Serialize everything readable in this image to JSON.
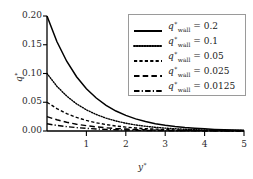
{
  "chart_data": {
    "type": "line",
    "title": "",
    "xlabel": "y*",
    "ylabel": "q*",
    "xlim": [
      0,
      5
    ],
    "ylim": [
      0,
      0.2
    ],
    "grid": false,
    "legend_position": "top-right",
    "xticks": [
      1,
      2,
      3,
      4,
      5
    ],
    "xtick_labels": [
      "1",
      "2",
      "3",
      "4",
      "5"
    ],
    "yticks": [
      0.0,
      0.05,
      0.1,
      0.15,
      0.2
    ],
    "ytick_labels": [
      "0.00",
      "0.05",
      "0.10",
      "0.15",
      "0.20"
    ],
    "series": [
      {
        "name": "q*_wall = 0.2",
        "legend_label": "= 0.2",
        "style": "solid",
        "q_wall": 0.2,
        "x": [
          0,
          0.25,
          0.5,
          0.75,
          1,
          1.25,
          1.5,
          1.75,
          2,
          2.25,
          2.5,
          2.75,
          3,
          3.25,
          3.5,
          3.75,
          4,
          4.25,
          4.5,
          4.75,
          5
        ],
        "y": [
          0.2,
          0.1557,
          0.1213,
          0.0944,
          0.0736,
          0.0573,
          0.0446,
          0.0347,
          0.0271,
          0.0211,
          0.0164,
          0.0128,
          0.01,
          0.0078,
          0.006,
          0.0047,
          0.0037,
          0.0028,
          0.0022,
          0.0017,
          0.0013
        ]
      },
      {
        "name": "q*_wall = 0.1",
        "legend_label": "= 0.1",
        "style": "dotted",
        "q_wall": 0.1,
        "x": [
          0,
          0.25,
          0.5,
          0.75,
          1,
          1.25,
          1.5,
          1.75,
          2,
          2.25,
          2.5,
          2.75,
          3,
          3.25,
          3.5,
          3.75,
          4,
          4.25,
          4.5,
          4.75,
          5
        ],
        "y": [
          0.1,
          0.0779,
          0.0607,
          0.0472,
          0.0368,
          0.0287,
          0.0223,
          0.0174,
          0.0135,
          0.0105,
          0.0082,
          0.0064,
          0.005,
          0.0039,
          0.003,
          0.0023,
          0.0018,
          0.0014,
          0.0011,
          0.0009,
          0.0007
        ]
      },
      {
        "name": "q*_wall = 0.05",
        "legend_label": "= 0.05",
        "style": "dashed",
        "q_wall": 0.05,
        "x": [
          0,
          0.25,
          0.5,
          0.75,
          1,
          1.25,
          1.5,
          1.75,
          2,
          2.25,
          2.5,
          2.75,
          3,
          3.25,
          3.5,
          3.75,
          4,
          4.25,
          4.5,
          4.75,
          5
        ],
        "y": [
          0.05,
          0.0389,
          0.0303,
          0.0236,
          0.0184,
          0.0143,
          0.0112,
          0.0087,
          0.0068,
          0.0053,
          0.0041,
          0.0032,
          0.0025,
          0.0019,
          0.0015,
          0.0012,
          0.0009,
          0.0007,
          0.0005,
          0.0004,
          0.0003
        ]
      },
      {
        "name": "q*_wall = 0.025",
        "legend_label": "= 0.025",
        "style": "longdash",
        "q_wall": 0.025,
        "x": [
          0,
          0.25,
          0.5,
          0.75,
          1,
          1.25,
          1.5,
          1.75,
          2,
          2.25,
          2.5,
          2.75,
          3,
          3.25,
          3.5,
          3.75,
          4,
          4.25,
          4.5,
          4.75,
          5
        ],
        "y": [
          0.025,
          0.0195,
          0.0152,
          0.0118,
          0.0092,
          0.0072,
          0.0056,
          0.0043,
          0.0034,
          0.0026,
          0.0021,
          0.0016,
          0.0012,
          0.001,
          0.0007,
          0.0006,
          0.0005,
          0.0004,
          0.0003,
          0.0002,
          0.0002
        ]
      },
      {
        "name": "q*_wall = 0.0125",
        "legend_label": "= 0.0125",
        "style": "dashdot",
        "q_wall": 0.0125,
        "x": [
          0,
          0.25,
          0.5,
          0.75,
          1,
          1.25,
          1.5,
          1.75,
          2,
          2.25,
          2.5,
          2.75,
          3,
          3.25,
          3.5,
          3.75,
          4,
          4.25,
          4.5,
          4.75,
          5
        ],
        "y": [
          0.0125,
          0.0097,
          0.0076,
          0.0059,
          0.0046,
          0.0036,
          0.0028,
          0.0022,
          0.0017,
          0.0013,
          0.001,
          0.0008,
          0.0006,
          0.0005,
          0.0004,
          0.0003,
          0.0002,
          0.0002,
          0.0001,
          0.0001,
          0.0001
        ]
      }
    ]
  },
  "legend": {
    "variable_base": "q",
    "variable_sup": "∗",
    "variable_sub": "wall"
  },
  "axes": {
    "x_label_base": "y",
    "x_label_sup": "∗",
    "y_label_base": "q",
    "y_label_sup": "∗"
  },
  "colors": {
    "line": "#000000",
    "axis": "#000000",
    "text": "#2b2b2b",
    "legend_border": "#9a9a9a",
    "background": "#ffffff"
  }
}
